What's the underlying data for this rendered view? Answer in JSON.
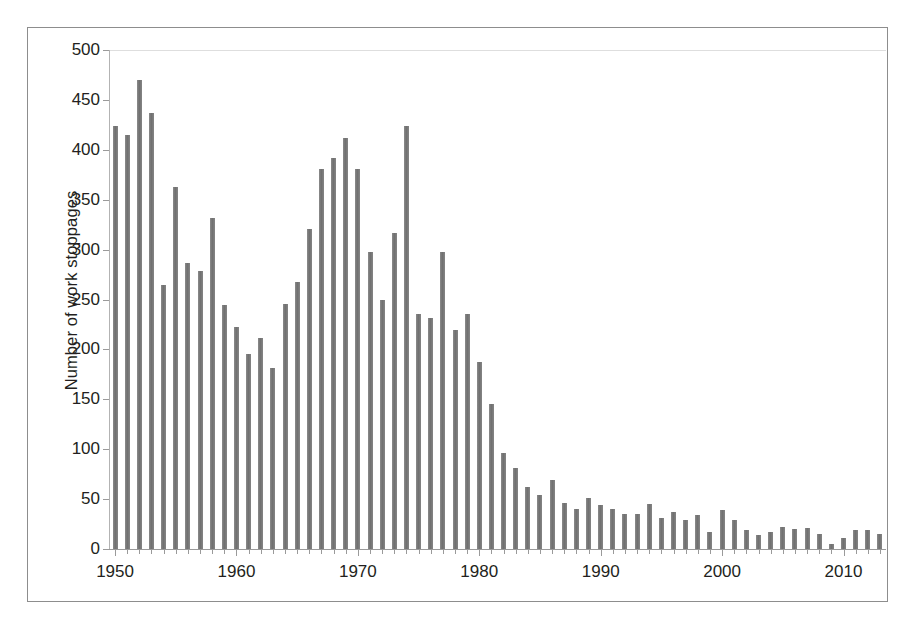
{
  "figure": {
    "background_color": "#ffffff",
    "frame_color": "#8d8d8d",
    "bar_color": "#777777",
    "axis_color": "#9a9a9a",
    "text_color": "#231f20"
  },
  "chart_data": {
    "type": "bar",
    "title": "",
    "subtitle": "",
    "xlabel": "",
    "ylabel": "Number of work stoppages",
    "ylim": [
      0,
      500
    ],
    "xlim": [
      1949.5,
      2013.5
    ],
    "ytick_labels": [
      "0",
      "50",
      "100",
      "150",
      "200",
      "250",
      "300",
      "350",
      "400",
      "450",
      "500"
    ],
    "ytick_values": [
      0,
      50,
      100,
      150,
      200,
      250,
      300,
      350,
      400,
      450,
      500
    ],
    "ytick_step": 50,
    "xtick_labels": [
      "1950",
      "1960",
      "1970",
      "1980",
      "1990",
      "2000",
      "2010"
    ],
    "xtick_values": [
      1950,
      1960,
      1970,
      1980,
      1990,
      2000,
      2010
    ],
    "xtick_minor_every": 1,
    "grid": "top-only",
    "legend": "none",
    "legend_position": "none",
    "categories": [
      1950,
      1951,
      1952,
      1953,
      1954,
      1955,
      1956,
      1957,
      1958,
      1959,
      1960,
      1961,
      1962,
      1963,
      1964,
      1965,
      1966,
      1967,
      1968,
      1969,
      1970,
      1971,
      1972,
      1973,
      1974,
      1975,
      1976,
      1977,
      1978,
      1979,
      1980,
      1981,
      1982,
      1983,
      1984,
      1985,
      1986,
      1987,
      1988,
      1989,
      1990,
      1991,
      1992,
      1993,
      1994,
      1995,
      1996,
      1997,
      1998,
      1999,
      2000,
      2001,
      2002,
      2003,
      2004,
      2005,
      2006,
      2007,
      2008,
      2009,
      2010,
      2011,
      2012,
      2013
    ],
    "values": [
      424,
      415,
      470,
      437,
      265,
      363,
      287,
      279,
      332,
      245,
      222,
      195,
      211,
      181,
      246,
      268,
      321,
      381,
      392,
      412,
      381,
      298,
      250,
      317,
      424,
      235,
      231,
      298,
      219,
      235,
      187,
      145,
      96,
      81,
      62,
      54,
      69,
      46,
      40,
      51,
      44,
      40,
      35,
      35,
      45,
      31,
      37,
      29,
      34,
      17,
      39,
      29,
      19,
      14,
      17,
      22,
      20,
      21,
      15,
      5,
      11,
      19,
      19,
      15
    ]
  }
}
